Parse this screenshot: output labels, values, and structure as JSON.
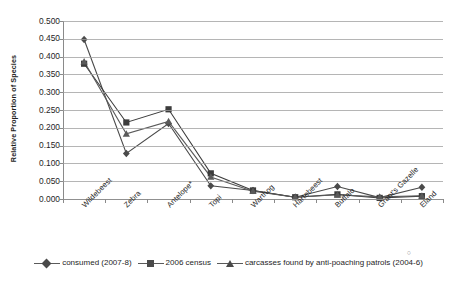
{
  "chart_data": {
    "type": "line",
    "title": "",
    "xlabel": "",
    "ylabel": "Relative Proportion of Species",
    "categories": [
      "Wildebeest",
      "Zebra",
      "Antelope*",
      "Topi",
      "Warthog",
      "Hartebeest",
      "Buffalo",
      "Grant's Gazelle",
      "Eland"
    ],
    "ylim": [
      0.0,
      0.5
    ],
    "ytick_step": 0.05,
    "yticks": [
      "0.000",
      "0.050",
      "0.100",
      "0.150",
      "0.200",
      "0.250",
      "0.300",
      "0.350",
      "0.400",
      "0.450",
      "0.500"
    ],
    "grid": true,
    "legend_position": "bottom",
    "series": [
      {
        "name": "consumed (2007-8)",
        "marker": "diamond",
        "color": "#4a4a4a",
        "values": [
          0.448,
          0.128,
          0.212,
          0.037,
          0.024,
          0.005,
          0.035,
          0.004,
          0.033
        ]
      },
      {
        "name": "2006 census",
        "marker": "square",
        "color": "#3c3c3c",
        "values": [
          0.38,
          0.215,
          0.252,
          0.072,
          0.024,
          0.005,
          0.013,
          0.003,
          0.008
        ]
      },
      {
        "name": "carcasses found by anti-poaching patrols (2004-6)",
        "marker": "triangle",
        "color": "#5a5a5a",
        "values": [
          0.386,
          0.183,
          0.218,
          0.062,
          0.022,
          0.005,
          0.012,
          0.006,
          0.009
        ]
      }
    ]
  },
  "legend": {
    "items": [
      {
        "label": "consumed (2007-8)",
        "marker": "diamond"
      },
      {
        "label": "2006 census",
        "marker": "square"
      },
      {
        "label": "carcasses found by anti-poaching patrols (2004-6)",
        "marker": "triangle"
      }
    ]
  },
  "axes": {
    "y_title": "Relative Proportion of Species"
  }
}
